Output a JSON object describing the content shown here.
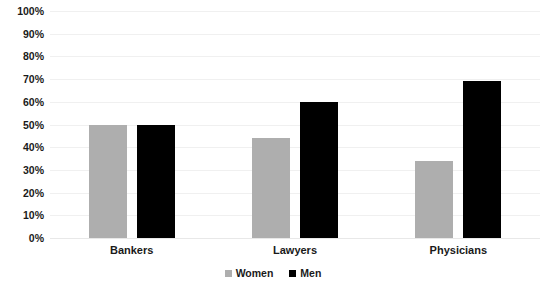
{
  "chart_data": {
    "type": "bar",
    "title": "",
    "xlabel": "",
    "ylabel": "",
    "ylim": [
      0,
      100
    ],
    "grid": true,
    "legend_position": "bottom-center",
    "categories": [
      "Bankers",
      "Lawyers",
      "Physicians"
    ],
    "ytick_labels": [
      "100%",
      "90%",
      "80%",
      "70%",
      "60%",
      "50%",
      "40%",
      "30%",
      "20%",
      "10%",
      "0%"
    ],
    "ytick_values": [
      100,
      90,
      80,
      70,
      60,
      50,
      40,
      30,
      20,
      10,
      0
    ],
    "series": [
      {
        "name": "Women",
        "color": "#aeaeae",
        "values": [
          50,
          44,
          34
        ]
      },
      {
        "name": "Men",
        "color": "#000000",
        "values": [
          50,
          60,
          69
        ]
      }
    ]
  },
  "colors": {
    "background": "#ffffff",
    "gridline": "#f0f0f0",
    "baseline": "#e8e8e8",
    "text": "#1a1a1a",
    "women": "#aeaeae",
    "men": "#000000"
  }
}
